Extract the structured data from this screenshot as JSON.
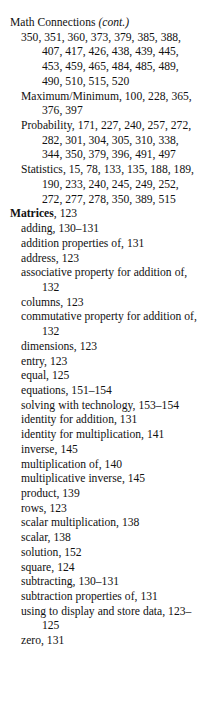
{
  "page": {
    "type": "book-index-column",
    "background_color": "#ffffff",
    "text_color": "#111111"
  },
  "index": {
    "entries": [
      {
        "level": "main",
        "heading": "Math Connections",
        "heading_style": "plain",
        "suffix": " (cont.)",
        "suffix_style": "italic",
        "locators": ""
      },
      {
        "level": "sub",
        "heading": "",
        "locators": "350, 351, 360, 373, 379, 385, 388, 407, 417, 426, 438, 439, 445, 453, 459, 465, 484, 485, 489, 490, 510, 515, 520"
      },
      {
        "level": "sub",
        "heading": "Maximum/Minimum",
        "locators": ", 100, 228, 365, 376, 397"
      },
      {
        "level": "sub",
        "heading": "Probability",
        "locators": ", 171, 227, 240, 257, 272, 282, 301, 304, 305, 310, 338, 344, 350, 379, 396, 491, 497"
      },
      {
        "level": "sub",
        "heading": "Statistics",
        "locators": ", 15, 78, 133, 135, 188, 189, 190, 233, 240, 245, 249, 252, 272, 277, 278, 350, 389, 515"
      },
      {
        "level": "main",
        "heading": "Matrices",
        "heading_style": "bold",
        "locators": ", 123"
      },
      {
        "level": "sub",
        "heading": "adding",
        "locators": ", 130–131"
      },
      {
        "level": "sub",
        "heading": "addition properties of",
        "locators": ", 131"
      },
      {
        "level": "sub",
        "heading": "address",
        "locators": ", 123"
      },
      {
        "level": "sub",
        "heading": "associative property for addition of",
        "locators": ", 132"
      },
      {
        "level": "sub",
        "heading": "columns",
        "locators": ", 123"
      },
      {
        "level": "sub",
        "heading": "commutative property for addition of",
        "locators": ", 132"
      },
      {
        "level": "sub",
        "heading": "dimensions",
        "locators": ", 123"
      },
      {
        "level": "sub",
        "heading": "entry",
        "locators": ", 123"
      },
      {
        "level": "sub",
        "heading": "equal",
        "locators": ", 125"
      },
      {
        "level": "sub",
        "heading": "equations",
        "locators": ", 151–154"
      },
      {
        "level": "sub",
        "heading": "solving with technology",
        "locators": ", 153–154"
      },
      {
        "level": "sub",
        "heading": "identity for addition",
        "locators": ", 131"
      },
      {
        "level": "sub",
        "heading": "identity for multiplication",
        "locators": ", 141"
      },
      {
        "level": "sub",
        "heading": "inverse",
        "locators": ", 145"
      },
      {
        "level": "sub",
        "heading": "multiplication of",
        "locators": ", 140"
      },
      {
        "level": "sub",
        "heading": "multiplicative inverse",
        "locators": ", 145"
      },
      {
        "level": "sub",
        "heading": "product",
        "locators": ", 139"
      },
      {
        "level": "sub",
        "heading": "rows",
        "locators": ", 123"
      },
      {
        "level": "sub",
        "heading": "scalar multiplication",
        "locators": ", 138"
      },
      {
        "level": "sub",
        "heading": "scalar",
        "locators": ", 138"
      },
      {
        "level": "sub",
        "heading": "solution",
        "locators": ", 152"
      },
      {
        "level": "sub",
        "heading": "square",
        "locators": ", 124"
      },
      {
        "level": "sub",
        "heading": "subtracting",
        "locators": ", 130–131"
      },
      {
        "level": "sub",
        "heading": "subtraction properties of",
        "locators": ", 131"
      },
      {
        "level": "sub",
        "heading": "using to display and store data",
        "locators": ", 123–125"
      },
      {
        "level": "sub",
        "heading": "zero",
        "locators": ", 131"
      }
    ]
  }
}
